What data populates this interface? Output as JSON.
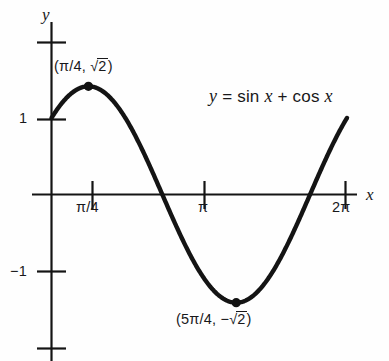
{
  "chart_data": {
    "type": "line",
    "title": "",
    "equation_label": "y = sin x + cos x",
    "function": "y = sin x + cos x",
    "xlabel": "x",
    "ylabel": "y",
    "xlim": [
      -0.4,
      7.2
    ],
    "ylim": [
      -2.35,
      2.35
    ],
    "grid": false,
    "legend": "none",
    "x_ticks": [
      {
        "value": 0.7853981634,
        "label": "π/4"
      },
      {
        "value": 3.1415926536,
        "label": "π"
      },
      {
        "value": 6.2831853072,
        "label": "2π"
      }
    ],
    "y_ticks": [
      {
        "value": 2,
        "label": ""
      },
      {
        "value": 1,
        "label": "1"
      },
      {
        "value": -1,
        "label": "−1"
      },
      {
        "value": -2,
        "label": ""
      }
    ],
    "annotations": [
      {
        "name": "maximum",
        "x": 0.7853981634,
        "y": 1.4142135624,
        "label_prefix": "(π/4, ",
        "label_radicand": "2",
        "label_suffix": ")",
        "label_plain": "(π/4, √2)"
      },
      {
        "name": "minimum",
        "x": 3.926990817,
        "y": -1.4142135624,
        "label_prefix": "(5π/4, −",
        "label_radicand": "2",
        "label_suffix": ")",
        "label_plain": "(5π/4, −√2)"
      }
    ],
    "zero_crossings": [
      2.3561944902,
      5.4977871438
    ],
    "x": [
      0,
      0.3926990817,
      0.7853981634,
      1.1780972451,
      1.5707963268,
      1.9634954085,
      2.3561944902,
      2.7488935719,
      3.1415926536,
      3.5342917353,
      3.926990817,
      4.3196898987,
      4.7123889804,
      5.1050880621,
      5.4977871438,
      5.8904862255,
      6.2831853072
    ],
    "y": [
      1,
      1.3065629649,
      1.4142135624,
      1.3065629649,
      1,
      0.5411961001,
      0,
      -0.5411961001,
      -1,
      -1.3065629649,
      -1.4142135624,
      -1.3065629649,
      -1,
      -0.5411961001,
      0,
      0.5411961001,
      1
    ],
    "series": [
      {
        "name": "y = sin x + cos x",
        "values": [
          1,
          1.3065629649,
          1.4142135624,
          1.3065629649,
          1,
          0.5411961001,
          0,
          -0.5411961001,
          -1,
          -1.3065629649,
          -1.4142135624,
          -1.3065629649,
          -1,
          -0.5411961001,
          0,
          0.5411961001,
          1
        ]
      }
    ],
    "colors": {
      "curve": "#141414",
      "axis": "#141414",
      "point": "#111111",
      "background": "#fefefe",
      "text": "#18181a"
    }
  },
  "labels": {
    "y_axis": "y",
    "x_axis": "x",
    "tick_y_1": "1",
    "tick_y_neg1": "−1",
    "tick_x_pi4": "π/4",
    "tick_x_pi": "π",
    "tick_x_2pi": "2π",
    "max_prefix": "(π/4, ",
    "max_radical_sign": "√",
    "max_radicand": "2",
    "max_suffix": ")",
    "min_prefix": "(5π/4, −",
    "min_radical_sign": "√",
    "min_radicand": "2",
    "min_suffix": ")",
    "eq_y": "y",
    "eq_equals": " = sin ",
    "eq_x1": "x",
    "eq_plus": "  +  cos ",
    "eq_x2": "x"
  }
}
